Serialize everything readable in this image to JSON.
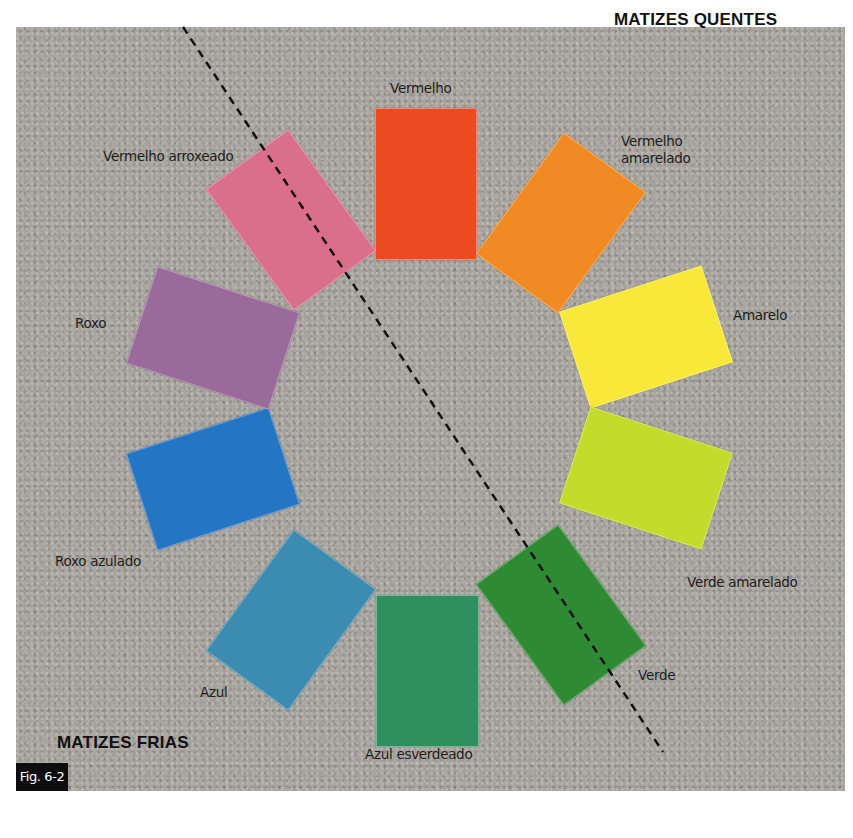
{
  "figure": {
    "tag": "Fig. 6-2",
    "background_color": "#a8a49e"
  },
  "headings": {
    "warm": "MATIZES QUENTES",
    "cool": "MATIZES FRIAS"
  },
  "divider": {
    "style": "dashed",
    "from": [
      183,
      27
    ],
    "to": [
      663,
      752
    ]
  },
  "swatches": [
    {
      "name": "Vermelho",
      "color": "#ec4b22"
    },
    {
      "name": "Vermelho amarelado",
      "color": "#f08a22"
    },
    {
      "name": "Amarelo",
      "color": "#f7e839"
    },
    {
      "name": "Verde amarelado",
      "color": "#c3dc2c"
    },
    {
      "name": "Verde",
      "color": "#2f8a34"
    },
    {
      "name": "Azul esverdeado",
      "color": "#2f8f5e"
    },
    {
      "name": "Azul",
      "color": "#3b8cb0"
    },
    {
      "name": "Roxo azulado",
      "color": "#2475c3"
    },
    {
      "name": "Roxo",
      "color": "#9a6b9a"
    },
    {
      "name": "Vermelho arroxeado",
      "color": "#d96f88"
    }
  ],
  "labels": {
    "vermelho": "Vermelho",
    "vermelho_amarelado": "Vermelho\namarelado",
    "amarelo": "Amarelo",
    "verde_amarelado": "Verde amarelado",
    "verde": "Verde",
    "azul_esverdeado": "Azul esverdeado",
    "azul": "Azul",
    "roxo_azulado": "Roxo azulado",
    "roxo": "Roxo",
    "vermelho_arroxeado": "Vermelho arroxeado"
  }
}
